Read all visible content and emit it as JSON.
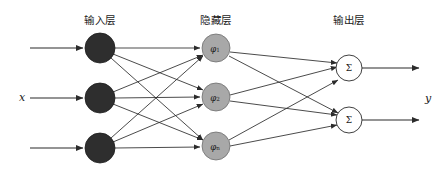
{
  "figure": {
    "kind": "neural-network-diagram",
    "width": 442,
    "height": 176,
    "background_color": "#ffffff"
  },
  "layer_titles": {
    "input": "输入层",
    "hidden": "隐藏层",
    "output": "输出层"
  },
  "io_labels": {
    "input_signal": "x",
    "output_signal": "y"
  },
  "nodes": {
    "input": [
      {
        "id": "in-1",
        "label": "",
        "cx": 100,
        "cy": 48,
        "r": 15,
        "fill": "#2e2e2e"
      },
      {
        "id": "in-2",
        "label": "",
        "cx": 100,
        "cy": 98,
        "r": 15,
        "fill": "#2e2e2e"
      },
      {
        "id": "in-3",
        "label": "",
        "cx": 100,
        "cy": 148,
        "r": 15,
        "fill": "#2e2e2e"
      }
    ],
    "hidden": [
      {
        "id": "hid-1",
        "base": "φ",
        "sub": "1",
        "cx": 216,
        "cy": 48,
        "r": 14,
        "fill": "#a8a8a8"
      },
      {
        "id": "hid-2",
        "base": "φ",
        "sub": "2",
        "cx": 216,
        "cy": 97,
        "r": 14,
        "fill": "#a8a8a8"
      },
      {
        "id": "hid-3",
        "base": "φ",
        "sub": "n",
        "cx": 216,
        "cy": 146,
        "r": 14,
        "fill": "#a8a8a8"
      }
    ],
    "output": [
      {
        "id": "out-1",
        "label": "Σ",
        "cx": 349,
        "cy": 68,
        "r": 13,
        "fill": "#ffffff"
      },
      {
        "id": "out-2",
        "label": "Σ",
        "cx": 349,
        "cy": 120,
        "r": 13,
        "fill": "#ffffff"
      }
    ]
  },
  "edges": {
    "input_to_hidden_fully_connected": true,
    "hidden_to_output_fully_connected": true,
    "input_to_hidden_count": 9,
    "hidden_to_output_count": 6,
    "stroke_color": "#2b2b2b"
  },
  "io_arrows": {
    "incoming": [
      {
        "y": 48,
        "x_start": 30,
        "x_end": 83
      },
      {
        "y": 98,
        "x_start": 30,
        "x_end": 83
      },
      {
        "y": 148,
        "x_start": 30,
        "x_end": 83
      }
    ],
    "outgoing": [
      {
        "y": 68,
        "x_start": 362,
        "x_end": 419
      },
      {
        "y": 120,
        "x_start": 362,
        "x_end": 419
      }
    ]
  },
  "title_positions": {
    "input_x": 100,
    "input_y": 21,
    "hidden_x": 216,
    "hidden_y": 21,
    "output_x": 349,
    "output_y": 21
  },
  "label_positions": {
    "x_label_x": 22,
    "x_label_y": 98,
    "y_label_x": 428,
    "y_label_y": 99
  }
}
